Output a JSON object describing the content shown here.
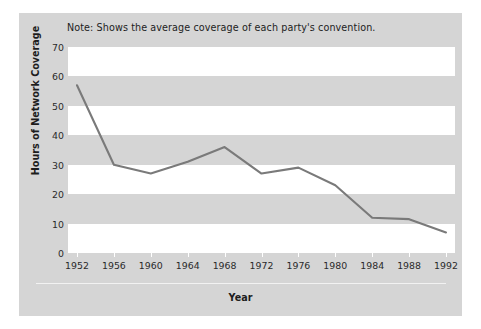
{
  "chart_data": {
    "type": "line",
    "title": "",
    "note": "Note: Shows the average coverage of each party's convention.",
    "xlabel": "Year",
    "ylabel": "Hours of Network Coverage",
    "categories": [
      1952,
      1956,
      1960,
      1964,
      1968,
      1972,
      1976,
      1980,
      1984,
      1988,
      1992
    ],
    "xtick_labels": [
      "1952",
      "1956",
      "1960",
      "1964",
      "1968",
      "1972",
      "1976",
      "1980",
      "1984",
      "1988",
      "1992"
    ],
    "values": [
      57,
      30,
      27,
      31,
      36,
      27,
      29,
      23,
      12,
      11.5,
      7
    ],
    "ytick_labels": [
      "0",
      "10",
      "20",
      "30",
      "40",
      "50",
      "60",
      "70"
    ],
    "yticks": [
      0,
      10,
      20,
      30,
      40,
      50,
      60,
      70
    ],
    "ylim": [
      0,
      70
    ],
    "xlim": [
      1952,
      1992
    ],
    "grid": "alternating horizontal bands",
    "legend": "none",
    "series": [
      {
        "name": "Hours of Network Coverage",
        "values": [
          57,
          30,
          27,
          31,
          36,
          27,
          29,
          23,
          12,
          11.5,
          7
        ]
      }
    ],
    "colors": {
      "line": "#7a7a7a",
      "panel_background": "#d5d5d5",
      "band_light": "#ffffff",
      "band_dark": "#d5d5d5",
      "text": "#1d1d1d"
    }
  }
}
